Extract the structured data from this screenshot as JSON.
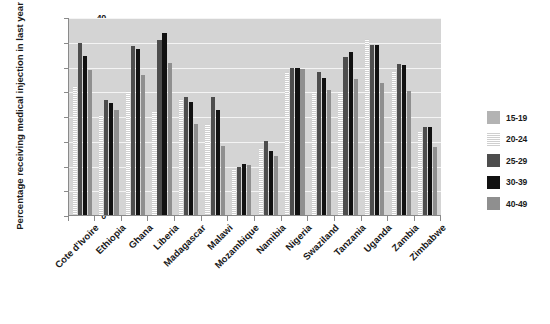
{
  "chart_data": {
    "type": "bar",
    "title": "",
    "xlabel": "",
    "ylabel": "Percentage receiving medical injection in last year",
    "ylim": [
      0,
      40
    ],
    "yticks": [
      0,
      5,
      10,
      15,
      20,
      25,
      30,
      35,
      40
    ],
    "grid": true,
    "legend_position": "right",
    "categories": [
      "Cote d'Ivoire",
      "Ethiopia",
      "Ghana",
      "Liberia",
      "Madagascar",
      "Malawi",
      "Mozambique",
      "Namibia",
      "Nigeria",
      "Swaziland",
      "Tanzania",
      "Uganda",
      "Zambia",
      "Zimbabwe"
    ],
    "series": [
      {
        "name": "15-19",
        "color": "#b3b3b3",
        "values": [
          null,
          null,
          null,
          null,
          null,
          null,
          null,
          null,
          null,
          null,
          null,
          null,
          null,
          null
        ]
      },
      {
        "name": "20-24",
        "color": "#cfcfcf",
        "values": [
          26.0,
          20.3,
          25.0,
          21.0,
          23.5,
          18.3,
          9.2,
          13.5,
          28.8,
          25.0,
          25.0,
          35.5,
          29.0,
          17.0
        ]
      },
      {
        "name": "25-29",
        "color": "#4d4d4d",
        "values": [
          34.8,
          23.3,
          34.2,
          35.3,
          23.8,
          23.8,
          9.6,
          15.0,
          29.8,
          28.8,
          32.0,
          34.3,
          30.5,
          17.7
        ]
      },
      {
        "name": "30-39",
        "color": "#111111",
        "values": [
          32.1,
          22.6,
          33.6,
          36.8,
          22.9,
          21.2,
          10.3,
          12.9,
          29.8,
          27.6,
          33.0,
          34.3,
          30.3,
          17.8
        ]
      },
      {
        "name": "40-49",
        "color": "#8f8f8f",
        "values": [
          29.2,
          21.3,
          28.2,
          30.8,
          18.3,
          14.0,
          10.2,
          12.0,
          29.5,
          25.2,
          27.5,
          26.7,
          25.0,
          13.8
        ]
      }
    ]
  },
  "legend": {
    "items": [
      {
        "label": "15-19",
        "swatch": "solid-light-gray"
      },
      {
        "label": "20-24",
        "swatch": "horizontal-stripes"
      },
      {
        "label": "25-29",
        "swatch": "solid-dark-gray"
      },
      {
        "label": "30-39",
        "swatch": "solid-black"
      },
      {
        "label": "40-49",
        "swatch": "solid-medium-gray"
      }
    ]
  },
  "caption": {
    "text": ""
  }
}
